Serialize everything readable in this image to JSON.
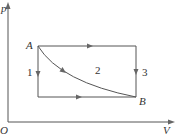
{
  "diagram": {
    "type": "p-V thermodynamic diagram",
    "axes": {
      "y_label": "p",
      "x_label": "V",
      "origin_label": "O"
    },
    "points": [
      {
        "label": "A"
      },
      {
        "label": "B"
      }
    ],
    "paths": [
      {
        "label": "1",
        "description": "A down to bottom-left corner, then right to B"
      },
      {
        "label": "2",
        "description": "curve from A to B"
      },
      {
        "label": "3",
        "description": "A right to top-right corner, then down to B"
      }
    ]
  }
}
